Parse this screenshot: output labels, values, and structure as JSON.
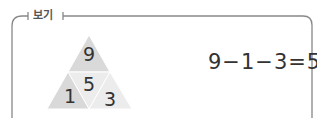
{
  "box": {
    "label": "보기"
  },
  "triangle": {
    "top": "9",
    "middle": "5",
    "bottom_left": "1",
    "bottom_right": "3",
    "colors": {
      "dark": "#d9d9d9",
      "light": "#ececec",
      "stroke": "#ffffff"
    }
  },
  "equation": "9−1−3=5"
}
